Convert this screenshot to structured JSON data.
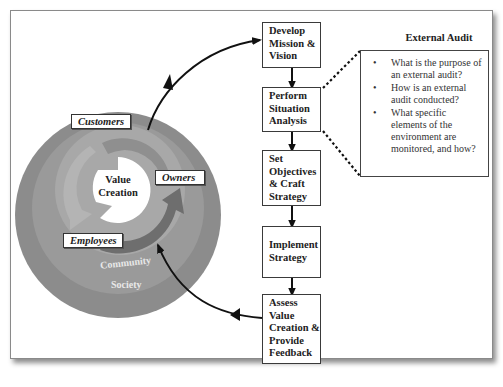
{
  "diagram": {
    "circle": {
      "center_label": "Value Creation",
      "stakeholders": [
        {
          "label": "Customers"
        },
        {
          "label": "Owners"
        },
        {
          "label": "Employees"
        }
      ],
      "rings": [
        {
          "label": "Community"
        },
        {
          "label": "Society"
        }
      ],
      "colors": {
        "society": "#8c8c8c",
        "community": "#9b9b9b",
        "inner_ring": "#a9a9a9",
        "arrow_segment": "#7a7a7a",
        "center": "#ffffff"
      }
    },
    "process_steps": [
      {
        "label_lines": [
          "Develop",
          "Mission &",
          "Vision"
        ]
      },
      {
        "label_lines": [
          "Perform",
          "Situation",
          "Analysis"
        ]
      },
      {
        "label_lines": [
          "Set",
          "Objectives",
          "& Craft",
          "Strategy"
        ]
      },
      {
        "label_lines": [
          "Implement",
          "Strategy"
        ]
      },
      {
        "label_lines": [
          "Assess",
          "Value",
          "Creation &",
          "Provide",
          "Feedback"
        ]
      }
    ],
    "callout": {
      "title": "External Audit",
      "bullets": [
        "What is the purpose of an external audit?",
        "How is an external audit conducted?",
        "What specific elements of the environment are monitored, and how?"
      ],
      "bullet_glyph": "•"
    }
  }
}
